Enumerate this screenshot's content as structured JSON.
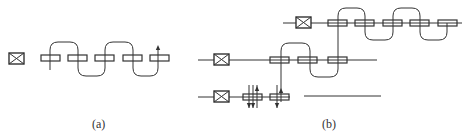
{
  "diagram": {
    "panels": [
      {
        "id": "a",
        "label": "(a)",
        "label_pos": {
          "x": 92,
          "y": 117
        },
        "crossed_boxes": [
          {
            "x": 9,
            "y": 53,
            "w": 15,
            "h": 11
          }
        ],
        "lines": [],
        "rects": [
          {
            "x": 41,
            "y": 55,
            "w": 19,
            "h": 6
          },
          {
            "x": 68,
            "y": 55,
            "w": 19,
            "h": 6
          },
          {
            "x": 95,
            "y": 55,
            "w": 19,
            "h": 6
          },
          {
            "x": 123,
            "y": 55,
            "w": 19,
            "h": 6
          },
          {
            "x": 150,
            "y": 55,
            "w": 19,
            "h": 6
          }
        ],
        "wire_path": "M50,70 L50,50 Q50,42 58,42 L70,42 Q78,42 78,50 L78,68 Q78,76 86,76 L97,76 Q105,76 105,68 L105,50 Q105,42 113,42 L125,42 Q133,42 133,50 L133,68 Q133,76 141,76 L150,76 Q158,76 158,68 L158,49",
        "arrows": [
          {
            "x": 158,
            "y": 45,
            "dir": "up"
          }
        ]
      },
      {
        "id": "b",
        "label": "(b)",
        "label_pos": {
          "x": 322,
          "y": 117
        },
        "crossed_boxes": [
          {
            "x": 296,
            "y": 17,
            "w": 15,
            "h": 11
          },
          {
            "x": 214,
            "y": 54,
            "w": 15,
            "h": 11
          },
          {
            "x": 214,
            "y": 91,
            "w": 15,
            "h": 11
          }
        ],
        "lines": [
          {
            "x1": 283,
            "y1": 23,
            "x2": 462,
            "y2": 23
          },
          {
            "x1": 198,
            "y1": 60,
            "x2": 214,
            "y2": 60
          },
          {
            "x1": 229,
            "y1": 60,
            "x2": 377,
            "y2": 60
          },
          {
            "x1": 198,
            "y1": 97,
            "x2": 214,
            "y2": 97
          },
          {
            "x1": 229,
            "y1": 97,
            "x2": 290,
            "y2": 97
          },
          {
            "x1": 304,
            "y1": 96,
            "x2": 381,
            "y2": 96
          }
        ],
        "rects": [
          {
            "x": 328,
            "y": 20,
            "w": 19,
            "h": 6
          },
          {
            "x": 355,
            "y": 20,
            "w": 19,
            "h": 6
          },
          {
            "x": 383,
            "y": 20,
            "w": 19,
            "h": 6
          },
          {
            "x": 410,
            "y": 20,
            "w": 19,
            "h": 6
          },
          {
            "x": 438,
            "y": 20,
            "w": 19,
            "h": 6
          },
          {
            "x": 270,
            "y": 57,
            "w": 19,
            "h": 6
          },
          {
            "x": 298,
            "y": 57,
            "w": 19,
            "h": 6
          },
          {
            "x": 328,
            "y": 57,
            "w": 19,
            "h": 6
          },
          {
            "x": 243,
            "y": 94,
            "w": 19,
            "h": 6
          },
          {
            "x": 270,
            "y": 94,
            "w": 19,
            "h": 6
          }
        ],
        "wire_path": "M281,102 L281,51 Q281,43 289,43 L302,43 Q310,43 310,51 L310,69 Q310,77 318,77 L330,77 Q338,77 338,69 L338,16 Q338,8 346,8 L357,8 Q365,8 365,16 L365,32 Q365,40 373,40 L385,40 Q393,40 393,32 L393,16 Q393,8 401,8 L412,8 Q420,8 420,16 L420,32 Q420,40 428,40 L439,40 Q447,40 447,32 L447,23",
        "ticks": [
          {
            "x1": 249,
            "y1": 85,
            "x2": 249,
            "y2": 108
          },
          {
            "x1": 253,
            "y1": 85,
            "x2": 253,
            "y2": 108
          },
          {
            "x1": 257,
            "y1": 85,
            "x2": 257,
            "y2": 108
          },
          {
            "x1": 277,
            "y1": 85,
            "x2": 277,
            "y2": 108
          }
        ],
        "arrows": [
          {
            "x": 257,
            "y": 86,
            "dir": "up"
          },
          {
            "x": 249,
            "y": 108,
            "dir": "down"
          },
          {
            "x": 253,
            "y": 108,
            "dir": "down"
          },
          {
            "x": 281,
            "y": 88,
            "dir": "up"
          },
          {
            "x": 277,
            "y": 108,
            "dir": "down"
          }
        ]
      }
    ],
    "stroke_color": "#333333",
    "rect_fill": "#ffffff",
    "background": "#ffffff"
  }
}
